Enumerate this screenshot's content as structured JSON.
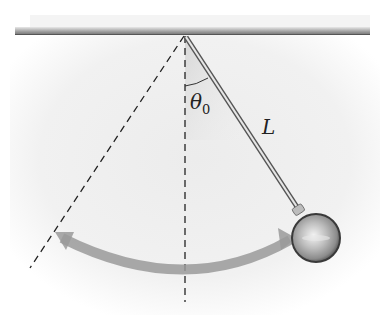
{
  "diagram": {
    "type": "simple-pendulum",
    "labels": {
      "angle": "θ",
      "angle_subscript": "0",
      "length": "L"
    },
    "colors": {
      "ceiling": "#8a8a8a",
      "dashed": "#222222",
      "rod": "#9a9a9a",
      "bob": "#b8b8b8",
      "arc_arrow": "#9a9a9a",
      "background_haze": "#e9e9e9"
    }
  }
}
